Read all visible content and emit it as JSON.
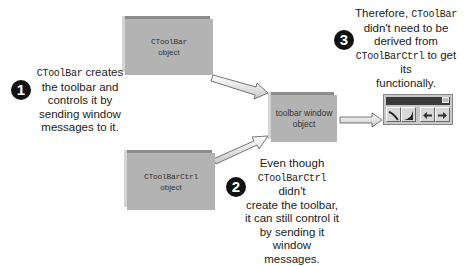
{
  "boxes": {
    "ctoolbar": {
      "class_name": "CToolBar",
      "label": "object"
    },
    "ctoolbarctrl": {
      "class_name": "CToolBarCtrl",
      "label": "object"
    },
    "toolbar_window": {
      "line1": "toolbar window",
      "line2": "object"
    }
  },
  "notes": {
    "one": {
      "number": "1",
      "code": "CToolBar",
      "text_after_code": " creates",
      "line2": "the toolbar and",
      "line3": "controls it by",
      "line4": "sending window",
      "line5": "messages to it."
    },
    "two": {
      "number": "2",
      "line1": "Even though",
      "code": "CToolBarCtrl",
      "text_after_code": " didn't",
      "line3": "create the toolbar,",
      "line4": "it can still control it",
      "line5": "by sending it",
      "line6": "window messages."
    },
    "three": {
      "number": "3",
      "text_before_code": "Therefore, ",
      "code": "CToolBar",
      "line2": "didn't need to be",
      "line3": "derived from",
      "code2": "CToolBarCtrl",
      "text_after_code2": " to get its",
      "line5": "functionally."
    }
  },
  "toolbar_widget": {
    "buttons": [
      "curve-down-icon",
      "curve-up-icon",
      "arrow-left-icon",
      "arrow-right-icon"
    ]
  },
  "colors": {
    "box_fill": "#b3b3b3",
    "arrow_fill": "#e8e8e8",
    "bullet": "#111111"
  }
}
